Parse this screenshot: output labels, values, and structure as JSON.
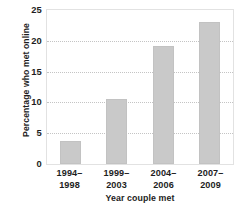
{
  "chart_data": {
    "type": "bar",
    "title": "",
    "categories": [
      "1994–\n1998",
      "1999–\n2003",
      "2004–\n2006",
      "2007–\n2009"
    ],
    "category_lines": [
      [
        "1994–",
        "1998"
      ],
      [
        "1999–",
        "2003"
      ],
      [
        "2004–",
        "2006"
      ],
      [
        "2007–",
        "2009"
      ]
    ],
    "values": [
      3.8,
      10.5,
      19.2,
      23.0
    ],
    "xlabel": "Year couple met",
    "ylabel": "Percentage who met online",
    "ylim": [
      0,
      25
    ],
    "yticks": [
      0,
      5,
      10,
      15,
      20,
      25
    ],
    "ytick_labels": [
      "0",
      "5",
      "10",
      "15",
      "20",
      "25"
    ],
    "grid": true,
    "grid_axis": "y",
    "grid_style": "dotted",
    "legend": "none",
    "bar_color": "#c9c9c9",
    "grid_color": "#c4c4c4",
    "axis_color": "#e2e2e2",
    "text_color": "#1d1d1d"
  }
}
